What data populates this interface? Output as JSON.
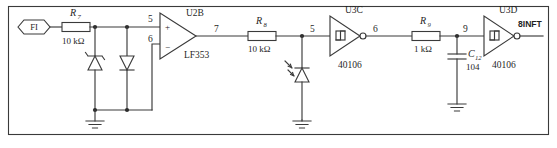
{
  "diagram": {
    "border": "rectangle"
  },
  "ports": {
    "input": {
      "name": "input-port",
      "label": "FI",
      "shape": "hexagon"
    },
    "output": {
      "name": "output-net",
      "label": "8INFT"
    }
  },
  "resistors": [
    {
      "ref": "R",
      "sub": "7",
      "value": "10 kΩ",
      "name": "resistor-r7"
    },
    {
      "ref": "R",
      "sub": "8",
      "value": "10 kΩ",
      "name": "resistor-r8"
    },
    {
      "ref": "R",
      "sub": "9",
      "value": "1 kΩ",
      "name": "resistor-r9"
    }
  ],
  "capacitors": [
    {
      "ref": "C",
      "sub": "12",
      "value": "104",
      "name": "capacitor-c12"
    }
  ],
  "diodes": [
    {
      "name": "zener-diode-d1",
      "type": "zener",
      "orientation": "cathode-up"
    },
    {
      "name": "diode-d2",
      "type": "standard",
      "orientation": "cathode-down"
    },
    {
      "name": "photodiode-d3",
      "type": "photodiode",
      "orientation": "cathode-up"
    }
  ],
  "ics": [
    {
      "name": "opamp-u2b",
      "designator": "U2B",
      "part": "LF353",
      "plus_symbol": "+",
      "minus_symbol": "−",
      "pins": {
        "noninverting": "5",
        "inverting": "6",
        "output": "7"
      }
    },
    {
      "name": "inverter-u3c",
      "designator": "U3C",
      "part": "40106",
      "pins": {
        "input": "5",
        "output": "6"
      }
    },
    {
      "name": "inverter-u3d",
      "designator": "U3D",
      "part": "40106",
      "pins": {
        "input": "9",
        "output": "8INFT"
      }
    }
  ],
  "nodes": [
    {
      "name": "node-5",
      "label": "5"
    },
    {
      "name": "node-6",
      "label": "6"
    },
    {
      "name": "node-7",
      "label": "7"
    },
    {
      "name": "node-5b",
      "label": "5"
    },
    {
      "name": "node-6b",
      "label": "6"
    },
    {
      "name": "node-9",
      "label": "9"
    }
  ],
  "grounds": [
    {
      "name": "ground-left"
    },
    {
      "name": "ground-middle"
    },
    {
      "name": "ground-right"
    }
  ],
  "colors": {
    "wire": "#3a3a3a",
    "text": "#1f1f1f",
    "background": "#ffffff"
  }
}
